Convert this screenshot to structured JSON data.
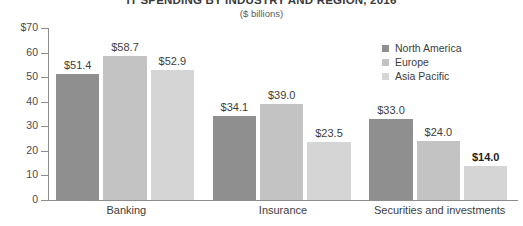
{
  "chart_data": {
    "type": "bar",
    "title": "IT SPENDING BY INDUSTRY AND REGION, 2016",
    "subtitle": "($ billions)",
    "xlabel": "",
    "ylabel": "",
    "ylim": [
      0,
      70
    ],
    "grid": false,
    "legend_position": "top-right",
    "y_ticks": [
      {
        "value": 70,
        "label": "$70"
      },
      {
        "value": 60,
        "label": "60"
      },
      {
        "value": 50,
        "label": "50"
      },
      {
        "value": 40,
        "label": "40"
      },
      {
        "value": 30,
        "label": "30"
      },
      {
        "value": 20,
        "label": "20"
      },
      {
        "value": 10,
        "label": "10"
      },
      {
        "value": 0,
        "label": "0"
      }
    ],
    "categories": [
      "Banking",
      "Insurance",
      "Securities and investments"
    ],
    "series": [
      {
        "name": "North America",
        "color": "#8f8f8f",
        "values": [
          51.4,
          34.1,
          33.0
        ],
        "labels": [
          "$51.4",
          "$34.1",
          "$33.0"
        ]
      },
      {
        "name": "Europe",
        "color": "#c3c3c3",
        "values": [
          58.7,
          39.0,
          24.0
        ],
        "labels": [
          "$58.7",
          "$39.0",
          "$24.0"
        ]
      },
      {
        "name": "Asia Pacific",
        "color": "#d5d5d5",
        "values": [
          52.9,
          23.5,
          14.0
        ],
        "labels": [
          "$52.9",
          "$23.5",
          "$14.0"
        ]
      }
    ],
    "emphasized_labels": [
      "$14.0"
    ]
  },
  "legend": {
    "items": [
      {
        "label": "North America",
        "color": "#8f8f8f"
      },
      {
        "label": "Europe",
        "color": "#c3c3c3"
      },
      {
        "label": "Asia Pacific",
        "color": "#d5d5d5"
      }
    ]
  }
}
